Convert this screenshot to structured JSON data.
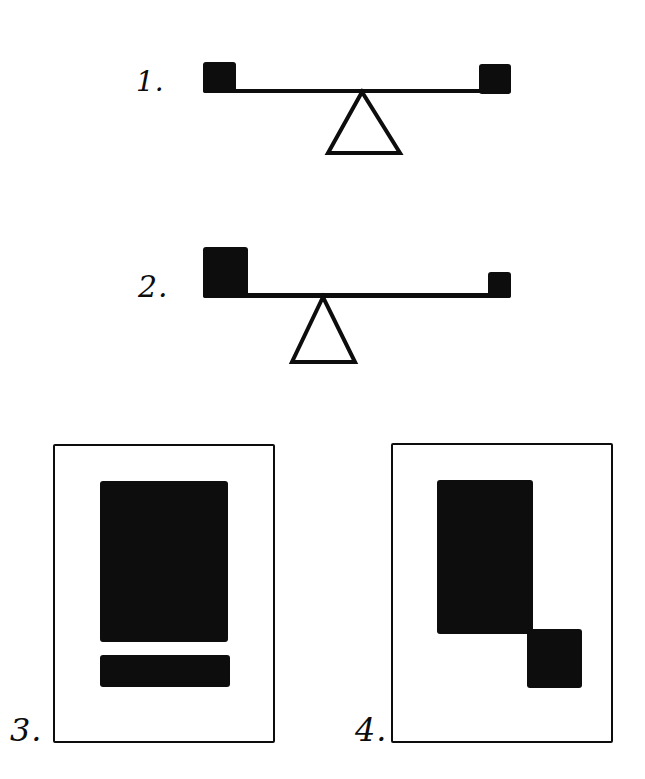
{
  "colors": {
    "ink": "#0d0d0d",
    "paper": "#ffffff"
  },
  "figures": {
    "fig1": {
      "label": "1."
    },
    "fig2": {
      "label": "2."
    },
    "fig3": {
      "label": "3."
    },
    "fig4": {
      "label": "4."
    }
  }
}
